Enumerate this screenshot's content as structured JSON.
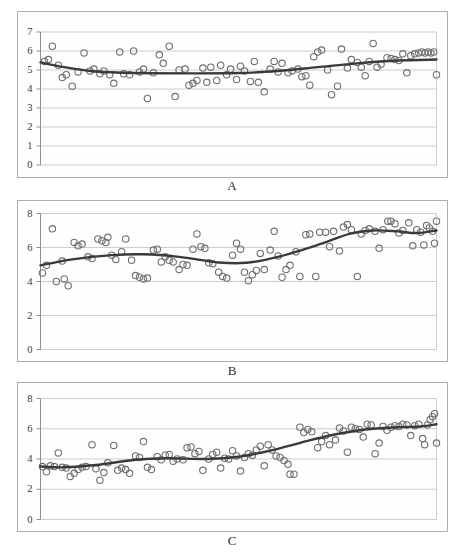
{
  "page": {
    "background": "#ffffff"
  },
  "style": {
    "point_color": "#6f6f6f",
    "trend_color": "#3a3a3a",
    "grid_color": "#cccccc",
    "frame_color": "#aeaeae",
    "axis_color": "#8f8f8f",
    "tick_label_color": "#3a3a3a",
    "plot_bg": "#fffefd"
  },
  "chart_data": [
    {
      "type": "scatter",
      "label": "A",
      "title": "",
      "xlabel": "",
      "ylabel": "",
      "xlim": [
        0,
        100
      ],
      "ylim": [
        0,
        7
      ],
      "yticks": [
        0,
        1,
        2,
        3,
        4,
        5,
        6,
        7
      ],
      "grid": true,
      "legend": false,
      "marker": "open-circle",
      "points": [
        [
          1,
          5.45
        ],
        [
          2,
          5.55
        ],
        [
          3,
          6.25
        ],
        [
          4.5,
          5.25
        ],
        [
          5.5,
          4.6
        ],
        [
          6.5,
          4.75
        ],
        [
          8,
          4.15
        ],
        [
          9.5,
          4.9
        ],
        [
          11,
          5.9
        ],
        [
          12.5,
          4.95
        ],
        [
          13.5,
          5.05
        ],
        [
          15,
          4.8
        ],
        [
          16,
          4.95
        ],
        [
          17.5,
          4.75
        ],
        [
          18.5,
          4.3
        ],
        [
          20,
          5.95
        ],
        [
          21,
          4.8
        ],
        [
          22.5,
          4.75
        ],
        [
          23.5,
          6.0
        ],
        [
          25,
          4.9
        ],
        [
          26,
          5.05
        ],
        [
          27,
          3.5
        ],
        [
          28.5,
          4.85
        ],
        [
          30,
          5.8
        ],
        [
          31,
          5.35
        ],
        [
          32.5,
          6.25
        ],
        [
          34,
          3.6
        ],
        [
          35,
          5.0
        ],
        [
          36.5,
          5.05
        ],
        [
          37.5,
          4.2
        ],
        [
          38.5,
          4.3
        ],
        [
          39.5,
          4.45
        ],
        [
          41,
          5.1
        ],
        [
          42,
          4.35
        ],
        [
          43,
          5.15
        ],
        [
          44.5,
          4.45
        ],
        [
          45.5,
          5.25
        ],
        [
          47,
          4.75
        ],
        [
          48,
          5.05
        ],
        [
          49.5,
          4.5
        ],
        [
          50.5,
          5.2
        ],
        [
          51.5,
          4.95
        ],
        [
          53,
          4.4
        ],
        [
          54,
          5.45
        ],
        [
          55,
          4.35
        ],
        [
          56.5,
          3.85
        ],
        [
          58,
          5.05
        ],
        [
          59,
          5.45
        ],
        [
          60,
          4.9
        ],
        [
          61,
          5.35
        ],
        [
          62.5,
          4.85
        ],
        [
          63.5,
          4.95
        ],
        [
          65,
          5.05
        ],
        [
          66,
          4.65
        ],
        [
          67,
          4.7
        ],
        [
          68,
          4.2
        ],
        [
          69,
          5.7
        ],
        [
          70,
          5.95
        ],
        [
          71,
          6.05
        ],
        [
          72.5,
          5.0
        ],
        [
          73.5,
          3.7
        ],
        [
          75,
          4.15
        ],
        [
          76,
          6.1
        ],
        [
          77.5,
          5.1
        ],
        [
          78.5,
          5.55
        ],
        [
          80,
          5.4
        ],
        [
          81,
          5.15
        ],
        [
          82,
          4.7
        ],
        [
          83,
          5.45
        ],
        [
          84,
          6.4
        ],
        [
          85,
          5.15
        ],
        [
          86,
          5.3
        ],
        [
          87.5,
          5.65
        ],
        [
          88.5,
          5.6
        ],
        [
          89.5,
          5.55
        ],
        [
          90.5,
          5.5
        ],
        [
          91.5,
          5.85
        ],
        [
          92.5,
          4.85
        ],
        [
          93.5,
          5.75
        ],
        [
          94.5,
          5.85
        ],
        [
          95.5,
          5.9
        ],
        [
          96.3,
          5.95
        ],
        [
          97.1,
          5.9
        ],
        [
          97.9,
          5.95
        ],
        [
          98.6,
          5.9
        ],
        [
          99.3,
          5.95
        ],
        [
          100,
          4.75
        ]
      ],
      "trend": [
        [
          0,
          5.4
        ],
        [
          6,
          5.15
        ],
        [
          14,
          4.92
        ],
        [
          25,
          4.84
        ],
        [
          38,
          4.82
        ],
        [
          50,
          4.84
        ],
        [
          60,
          4.95
        ],
        [
          70,
          5.15
        ],
        [
          80,
          5.35
        ],
        [
          90,
          5.5
        ],
        [
          100,
          5.55
        ]
      ]
    },
    {
      "type": "scatter",
      "label": "B",
      "title": "",
      "xlabel": "",
      "ylabel": "",
      "xlim": [
        0,
        100
      ],
      "ylim": [
        0,
        8
      ],
      "yticks": [
        0,
        2,
        4,
        6,
        8
      ],
      "grid": true,
      "legend": false,
      "marker": "open-circle",
      "points": [
        [
          0.5,
          4.5
        ],
        [
          1.5,
          4.95
        ],
        [
          3,
          7.1
        ],
        [
          4,
          4.0
        ],
        [
          5.5,
          5.2
        ],
        [
          6,
          4.15
        ],
        [
          7,
          3.75
        ],
        [
          8.5,
          6.3
        ],
        [
          9.5,
          6.1
        ],
        [
          10.5,
          6.2
        ],
        [
          12,
          5.45
        ],
        [
          13,
          5.35
        ],
        [
          14.5,
          6.5
        ],
        [
          15.5,
          6.4
        ],
        [
          16.5,
          6.3
        ],
        [
          17,
          6.6
        ],
        [
          18,
          5.55
        ],
        [
          19,
          5.3
        ],
        [
          20.5,
          5.75
        ],
        [
          21.5,
          6.5
        ],
        [
          23,
          5.25
        ],
        [
          24,
          4.35
        ],
        [
          25,
          4.25
        ],
        [
          26,
          4.15
        ],
        [
          27,
          4.2
        ],
        [
          28.5,
          5.85
        ],
        [
          29.5,
          5.9
        ],
        [
          30.5,
          5.15
        ],
        [
          31.5,
          5.45
        ],
        [
          32.5,
          5.25
        ],
        [
          33.5,
          5.15
        ],
        [
          35,
          4.7
        ],
        [
          36,
          5.0
        ],
        [
          37,
          4.95
        ],
        [
          38.5,
          5.9
        ],
        [
          39.5,
          6.8
        ],
        [
          40.5,
          6.05
        ],
        [
          41.5,
          5.95
        ],
        [
          42.5,
          5.1
        ],
        [
          43.5,
          5.05
        ],
        [
          45,
          4.55
        ],
        [
          46,
          4.3
        ],
        [
          47,
          4.2
        ],
        [
          48.5,
          5.55
        ],
        [
          49.5,
          6.25
        ],
        [
          50.5,
          5.9
        ],
        [
          51.5,
          4.55
        ],
        [
          52.5,
          4.05
        ],
        [
          53.5,
          4.4
        ],
        [
          54.5,
          4.65
        ],
        [
          55.5,
          5.65
        ],
        [
          56.5,
          4.7
        ],
        [
          58,
          5.85
        ],
        [
          59,
          6.95
        ],
        [
          60,
          5.5
        ],
        [
          61,
          4.25
        ],
        [
          62,
          4.7
        ],
        [
          63,
          4.95
        ],
        [
          64.5,
          5.75
        ],
        [
          65.5,
          4.3
        ],
        [
          67,
          6.75
        ],
        [
          68,
          6.8
        ],
        [
          69.5,
          4.3
        ],
        [
          70.5,
          6.9
        ],
        [
          72,
          6.9
        ],
        [
          73,
          6.05
        ],
        [
          74,
          6.95
        ],
        [
          75.5,
          5.8
        ],
        [
          76.5,
          7.2
        ],
        [
          77.5,
          7.35
        ],
        [
          78.5,
          7.05
        ],
        [
          80,
          4.3
        ],
        [
          81,
          6.8
        ],
        [
          82,
          7.0
        ],
        [
          83,
          7.1
        ],
        [
          84.5,
          6.95
        ],
        [
          85.5,
          5.95
        ],
        [
          86.5,
          7.05
        ],
        [
          87.7,
          7.55
        ],
        [
          88.5,
          7.55
        ],
        [
          89.5,
          7.4
        ],
        [
          90.5,
          6.85
        ],
        [
          91.5,
          7.0
        ],
        [
          93,
          7.45
        ],
        [
          94,
          6.1
        ],
        [
          95,
          7.05
        ],
        [
          96,
          6.9
        ],
        [
          96.8,
          6.15
        ],
        [
          97.5,
          7.3
        ],
        [
          98.2,
          7.15
        ],
        [
          99,
          6.95
        ],
        [
          99.5,
          6.25
        ],
        [
          100,
          7.55
        ]
      ],
      "trend": [
        [
          0,
          4.95
        ],
        [
          8,
          5.3
        ],
        [
          18,
          5.55
        ],
        [
          26,
          5.6
        ],
        [
          35,
          5.45
        ],
        [
          45,
          5.12
        ],
        [
          52,
          5.1
        ],
        [
          60,
          5.45
        ],
        [
          70,
          6.15
        ],
        [
          78,
          6.8
        ],
        [
          84,
          7.0
        ],
        [
          90,
          6.95
        ],
        [
          95,
          6.85
        ],
        [
          100,
          7.0
        ]
      ]
    },
    {
      "type": "scatter",
      "label": "C",
      "title": "",
      "xlabel": "",
      "ylabel": "",
      "xlim": [
        0,
        100
      ],
      "ylim": [
        0,
        8
      ],
      "yticks": [
        0,
        2,
        4,
        6,
        8
      ],
      "grid": true,
      "legend": false,
      "marker": "open-circle",
      "points": [
        [
          0.5,
          3.5
        ],
        [
          1.5,
          3.15
        ],
        [
          2.5,
          3.55
        ],
        [
          3.5,
          3.5
        ],
        [
          4.5,
          4.4
        ],
        [
          5.5,
          3.45
        ],
        [
          6.5,
          3.4
        ],
        [
          7.5,
          2.85
        ],
        [
          8.5,
          3.05
        ],
        [
          9.5,
          3.3
        ],
        [
          10.5,
          3.45
        ],
        [
          11.5,
          3.5
        ],
        [
          13,
          4.95
        ],
        [
          14,
          3.35
        ],
        [
          15,
          2.6
        ],
        [
          16,
          3.1
        ],
        [
          17,
          3.75
        ],
        [
          18.5,
          4.9
        ],
        [
          19.5,
          3.25
        ],
        [
          20.5,
          3.4
        ],
        [
          21.5,
          3.3
        ],
        [
          22.5,
          3.05
        ],
        [
          24,
          4.2
        ],
        [
          25,
          4.1
        ],
        [
          26,
          5.15
        ],
        [
          27,
          3.45
        ],
        [
          28,
          3.3
        ],
        [
          29.5,
          4.15
        ],
        [
          30.5,
          3.95
        ],
        [
          31.5,
          4.25
        ],
        [
          32.5,
          4.3
        ],
        [
          33.5,
          3.85
        ],
        [
          34.5,
          4.0
        ],
        [
          36,
          3.95
        ],
        [
          37,
          4.75
        ],
        [
          38,
          4.8
        ],
        [
          39,
          4.35
        ],
        [
          40,
          4.5
        ],
        [
          41,
          3.25
        ],
        [
          42.5,
          4.0
        ],
        [
          43.5,
          4.3
        ],
        [
          44.5,
          4.45
        ],
        [
          45.5,
          3.4
        ],
        [
          46.5,
          4.05
        ],
        [
          47.5,
          4.0
        ],
        [
          48.5,
          4.55
        ],
        [
          49.5,
          4.2
        ],
        [
          50.5,
          3.2
        ],
        [
          51.5,
          4.1
        ],
        [
          52.5,
          4.35
        ],
        [
          53.5,
          4.25
        ],
        [
          54.5,
          4.6
        ],
        [
          55.5,
          4.85
        ],
        [
          56.5,
          3.55
        ],
        [
          57.5,
          4.95
        ],
        [
          58.5,
          4.6
        ],
        [
          59.5,
          4.2
        ],
        [
          60.5,
          4.1
        ],
        [
          61.5,
          3.9
        ],
        [
          62.5,
          3.65
        ],
        [
          63,
          3.0
        ],
        [
          64,
          3.0
        ],
        [
          65.5,
          6.1
        ],
        [
          66.5,
          5.75
        ],
        [
          67.5,
          5.95
        ],
        [
          68.5,
          5.8
        ],
        [
          70,
          4.75
        ],
        [
          71,
          5.15
        ],
        [
          72,
          5.55
        ],
        [
          73,
          4.95
        ],
        [
          74.5,
          5.25
        ],
        [
          75.5,
          6.05
        ],
        [
          76.5,
          5.85
        ],
        [
          77.5,
          4.45
        ],
        [
          78.5,
          6.1
        ],
        [
          79.5,
          6.0
        ],
        [
          80.5,
          5.95
        ],
        [
          81.5,
          5.45
        ],
        [
          82.5,
          6.3
        ],
        [
          83.5,
          6.25
        ],
        [
          84.5,
          4.35
        ],
        [
          85.5,
          5.05
        ],
        [
          86.5,
          6.15
        ],
        [
          87.5,
          5.9
        ],
        [
          88.5,
          6.1
        ],
        [
          89.5,
          6.2
        ],
        [
          90.5,
          6.15
        ],
        [
          91.5,
          6.3
        ],
        [
          92.5,
          6.25
        ],
        [
          93.5,
          5.55
        ],
        [
          94.5,
          6.2
        ],
        [
          95.5,
          6.3
        ],
        [
          96.5,
          5.35
        ],
        [
          97,
          4.95
        ],
        [
          97.7,
          6.25
        ],
        [
          98.4,
          6.6
        ],
        [
          99,
          6.8
        ],
        [
          99.5,
          7.0
        ],
        [
          100,
          5.05
        ]
      ],
      "trend": [
        [
          0,
          3.5
        ],
        [
          6,
          3.45
        ],
        [
          14,
          3.6
        ],
        [
          24,
          3.95
        ],
        [
          32,
          4.05
        ],
        [
          42,
          4.0
        ],
        [
          50,
          4.15
        ],
        [
          58,
          4.55
        ],
        [
          66,
          5.1
        ],
        [
          74,
          5.6
        ],
        [
          82,
          5.95
        ],
        [
          90,
          6.1
        ],
        [
          96,
          6.15
        ],
        [
          100,
          6.3
        ]
      ]
    }
  ]
}
